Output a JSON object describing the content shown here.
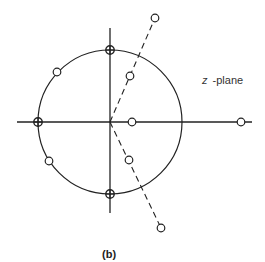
{
  "diagram": {
    "type": "pole-zero plot",
    "plane_label_var": "z",
    "plane_label_rest": " -plane",
    "caption": "(b)",
    "colors": {
      "stroke": "#222222",
      "background": "#ffffff"
    },
    "origin": [
      110,
      122
    ],
    "unit_circle_radius": 72,
    "axes": {
      "horizontal": {
        "x1": 17,
        "x2": 252,
        "y": 122
      },
      "vertical": {
        "x": 110,
        "y1": 28,
        "y2": 213
      }
    },
    "zeros_on_circle_with_cross": [
      {
        "name": "top",
        "x": 110,
        "y": 50
      },
      {
        "name": "left",
        "x": 38,
        "y": 122
      },
      {
        "name": "bottom",
        "x": 110,
        "y": 194
      }
    ],
    "zeros": [
      {
        "name": "upper-left-on-circle",
        "x": 57,
        "y": 72
      },
      {
        "name": "lower-left-on-circle",
        "x": 49,
        "y": 161
      },
      {
        "name": "inner-upper",
        "x": 130,
        "y": 76
      },
      {
        "name": "outer-upper",
        "x": 155,
        "y": 18
      },
      {
        "name": "inner-lower",
        "x": 129,
        "y": 160
      },
      {
        "name": "outer-lower",
        "x": 161,
        "y": 228
      },
      {
        "name": "inner-real",
        "x": 132,
        "y": 122
      },
      {
        "name": "outer-real",
        "x": 241,
        "y": 122
      }
    ],
    "dashed_lines": [
      {
        "name": "upper-ray",
        "x1": 110,
        "y1": 122,
        "x2": 155,
        "y2": 18
      },
      {
        "name": "lower-ray",
        "x1": 110,
        "y1": 122,
        "x2": 161,
        "y2": 228
      }
    ]
  }
}
